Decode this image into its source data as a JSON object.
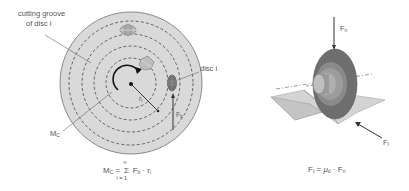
{
  "left_figure": {
    "labels": {
      "groove_line1": "cutting groove",
      "groove_line2": "of disc i",
      "disc": "disc i",
      "ri": "r",
      "ri_sub": "i",
      "fti": "F",
      "fti_sub": "ti",
      "mc": "M",
      "mc_sub": "C"
    },
    "formula": {
      "lhs": "M",
      "lhs_sub": "C",
      "eq": "=",
      "sigma": "Σ",
      "upper": "n",
      "lower": "i = 1",
      "term": "F",
      "term_sub": "ti",
      "dot": "·",
      "r": "r",
      "r_sub": "i"
    }
  },
  "right_figure": {
    "labels": {
      "fn": "F",
      "fn_sub": "n",
      "ft": "F",
      "ft_sub": "t"
    },
    "formula": {
      "lhs": "F",
      "lhs_sub": "t",
      "eq": "=",
      "mu": "μ",
      "mu_sub": "d",
      "dot": "·",
      "rhs": "F",
      "rhs_sub": "n"
    }
  },
  "colors": {
    "disc_fill": "#d9d9d9",
    "disc_stroke": "#8a8a8a",
    "groove": "#555555",
    "cutter_dark": "#6e6e6e",
    "cutter_mid": "#9a9a9a",
    "cutter_light": "#bdbdbd"
  }
}
